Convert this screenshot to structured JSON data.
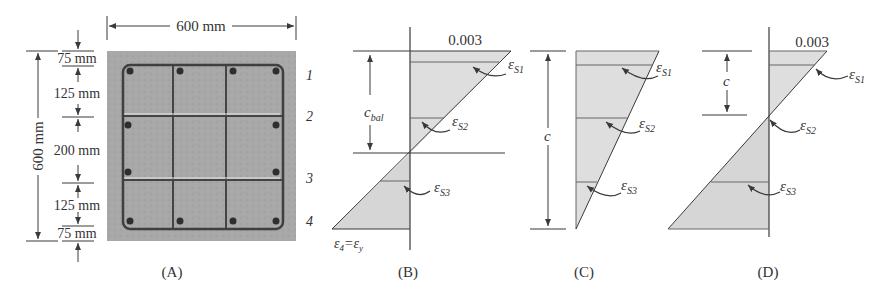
{
  "figure": {
    "panels": {
      "A": {
        "caption": "(A)",
        "width_dim": "600 mm",
        "height_dim": "600 mm",
        "spacings": [
          "75 mm",
          "125 mm",
          "200 mm",
          "125 mm",
          "75 mm"
        ],
        "layer_labels": [
          "1",
          "2",
          "3",
          "4"
        ]
      },
      "B": {
        "caption": "(B)",
        "top_strain": "0.003",
        "depth_label": "c",
        "depth_sub": "bal",
        "strains": [
          {
            "sym": "ε",
            "sub": "S1"
          },
          {
            "sym": "ε",
            "sub": "S2"
          },
          {
            "sym": "ε",
            "sub": "S3"
          }
        ],
        "bottom_label": {
          "lhs": "ε",
          "lhs_sub": "4",
          "eq": "=",
          "rhs": "ε",
          "rhs_sub": "y"
        }
      },
      "C": {
        "caption": "(C)",
        "depth_label": "c",
        "strains": [
          {
            "sym": "ε",
            "sub": "S1"
          },
          {
            "sym": "ε",
            "sub": "S2"
          },
          {
            "sym": "ε",
            "sub": "S3"
          }
        ]
      },
      "D": {
        "caption": "(D)",
        "top_strain": "0.003",
        "depth_label": "c",
        "strains": [
          {
            "sym": "ε",
            "sub": "S1"
          },
          {
            "sym": "ε",
            "sub": "S2"
          },
          {
            "sym": "ε",
            "sub": "S3"
          }
        ]
      }
    },
    "colors": {
      "line": "#3a3a3a",
      "fill": "#dcdcdc",
      "concrete": "#a9a9a9",
      "bar": "#444444"
    }
  }
}
